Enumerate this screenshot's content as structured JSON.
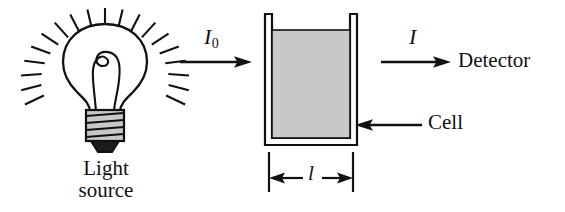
{
  "diagram": {
    "background_color": "#ffffff",
    "ink_color": "#111111",
    "solution_fill_color": "#c8c8c8",
    "labels": {
      "light_source_line1": "Light",
      "light_source_line2": "source",
      "incident_intensity": "I",
      "incident_intensity_subscript": "0",
      "transmitted_intensity": "I",
      "detector": "Detector",
      "cell": "Cell",
      "path_length": "l"
    },
    "components": [
      {
        "name": "light-source-bulb",
        "label": "Light source"
      },
      {
        "name": "incident-beam-arrow",
        "label": "I0"
      },
      {
        "name": "sample-cell",
        "label": "Cell"
      },
      {
        "name": "transmitted-beam-arrow",
        "label": "I"
      },
      {
        "name": "detector",
        "label": "Detector"
      },
      {
        "name": "path-length-dimension",
        "label": "l"
      }
    ]
  }
}
